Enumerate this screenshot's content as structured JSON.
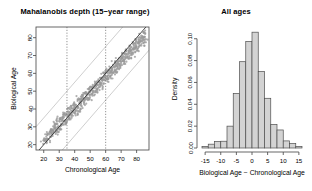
{
  "figure": {
    "background": "#ffffff",
    "panels": [
      "scatter",
      "histogram"
    ]
  },
  "scatter_panel": {
    "title": "Mahalanobis depth (15−year range)",
    "xlabel": "Chronological Age",
    "ylabel": "Biological Age"
  },
  "hist_panel": {
    "title": "All ages",
    "xlabel": "Biological Age − Chronological Age",
    "ylabel": "Density"
  },
  "chart_data": [
    {
      "type": "scatter",
      "title": "Mahalanobis depth (15−year range)",
      "xlabel": "Chronological Age",
      "ylabel": "Biological Age",
      "xlim": [
        15,
        88
      ],
      "ylim": [
        17,
        86
      ],
      "xticks": [
        20,
        30,
        40,
        50,
        60,
        70,
        80
      ],
      "yticks": [
        20,
        30,
        40,
        50,
        60,
        70,
        80
      ],
      "grid": false,
      "point_color": "#9a9a9a",
      "point_size": 1.1,
      "n_points": 620,
      "annotations": [
        {
          "kind": "identity-line",
          "style": "solid-dark",
          "color": "#2b2b2b",
          "slope": 1,
          "intercept": 0
        },
        {
          "kind": "upper-band-line",
          "style": "solid-light",
          "color": "#c8c8c8",
          "slope": 1,
          "intercept": 15
        },
        {
          "kind": "lower-band-line",
          "style": "solid-light",
          "color": "#c8c8c8",
          "slope": 1,
          "intercept": -15
        },
        {
          "kind": "vertical-cut-low",
          "style": "dotted",
          "color": "#777777",
          "x": 35
        },
        {
          "kind": "vertical-cut-high",
          "style": "dotted",
          "color": "#777777",
          "x": 60
        }
      ],
      "points": [
        [
          19.5,
          21.0
        ],
        [
          20.2,
          22.4
        ],
        [
          21.0,
          23.1
        ],
        [
          21.4,
          21.8
        ],
        [
          22.0,
          24.6
        ],
        [
          22.6,
          25.4
        ],
        [
          23.1,
          23.0
        ],
        [
          23.5,
          26.2
        ],
        [
          24.0,
          27.1
        ],
        [
          24.4,
          25.0
        ],
        [
          24.9,
          28.4
        ],
        [
          25.2,
          26.6
        ],
        [
          25.6,
          29.0
        ],
        [
          26.0,
          27.4
        ],
        [
          26.4,
          30.1
        ],
        [
          26.8,
          28.2
        ],
        [
          27.1,
          31.0
        ],
        [
          27.5,
          29.3
        ],
        [
          27.9,
          26.8
        ],
        [
          28.2,
          32.0
        ],
        [
          28.6,
          30.2
        ],
        [
          29.0,
          28.1
        ],
        [
          29.4,
          33.4
        ],
        [
          29.8,
          31.0
        ],
        [
          30.1,
          29.0
        ],
        [
          30.5,
          34.2
        ],
        [
          30.9,
          32.1
        ],
        [
          31.2,
          30.0
        ],
        [
          31.6,
          35.1
        ],
        [
          32.0,
          33.0
        ],
        [
          32.4,
          31.1
        ],
        [
          32.8,
          36.2
        ],
        [
          33.1,
          34.0
        ],
        [
          33.5,
          32.2
        ],
        [
          33.9,
          37.0
        ],
        [
          34.2,
          35.1
        ],
        [
          34.6,
          33.0
        ],
        [
          35.0,
          38.2
        ],
        [
          35.4,
          36.0
        ],
        [
          35.8,
          34.1
        ],
        [
          36.1,
          39.0
        ],
        [
          36.5,
          37.2
        ],
        [
          36.9,
          35.0
        ],
        [
          37.3,
          40.1
        ],
        [
          37.6,
          38.0
        ],
        [
          38.0,
          36.2
        ],
        [
          38.4,
          41.0
        ],
        [
          38.8,
          39.1
        ],
        [
          39.1,
          37.0
        ],
        [
          39.5,
          42.2
        ],
        [
          39.9,
          40.0
        ],
        [
          40.3,
          38.1
        ],
        [
          40.6,
          43.0
        ],
        [
          41.0,
          41.2
        ],
        [
          41.4,
          39.0
        ],
        [
          41.8,
          44.1
        ],
        [
          42.1,
          42.0
        ],
        [
          42.5,
          40.2
        ],
        [
          42.9,
          45.0
        ],
        [
          43.3,
          43.1
        ],
        [
          43.6,
          41.0
        ],
        [
          44.0,
          46.2
        ],
        [
          44.4,
          44.0
        ],
        [
          44.8,
          42.1
        ],
        [
          45.1,
          47.0
        ],
        [
          45.5,
          45.2
        ],
        [
          45.9,
          43.0
        ],
        [
          46.3,
          48.1
        ],
        [
          46.6,
          46.0
        ],
        [
          47.0,
          44.2
        ],
        [
          47.4,
          49.0
        ],
        [
          47.8,
          47.1
        ],
        [
          48.1,
          45.0
        ],
        [
          48.5,
          50.2
        ],
        [
          48.9,
          48.0
        ],
        [
          49.3,
          46.1
        ],
        [
          49.6,
          51.0
        ],
        [
          50.0,
          49.2
        ],
        [
          50.4,
          47.0
        ],
        [
          50.8,
          52.1
        ],
        [
          51.1,
          50.0
        ],
        [
          51.5,
          48.2
        ],
        [
          51.9,
          53.0
        ],
        [
          52.3,
          51.1
        ],
        [
          52.6,
          49.0
        ],
        [
          53.0,
          54.2
        ],
        [
          53.4,
          52.0
        ],
        [
          53.8,
          50.1
        ],
        [
          54.1,
          55.0
        ],
        [
          54.5,
          53.2
        ],
        [
          54.9,
          51.0
        ],
        [
          55.3,
          56.1
        ],
        [
          55.6,
          54.0
        ],
        [
          56.0,
          52.2
        ],
        [
          56.4,
          57.0
        ],
        [
          56.8,
          55.1
        ],
        [
          57.1,
          53.0
        ],
        [
          57.5,
          58.2
        ],
        [
          57.9,
          56.0
        ],
        [
          58.3,
          54.1
        ],
        [
          58.6,
          59.0
        ],
        [
          59.0,
          57.2
        ],
        [
          59.4,
          55.0
        ],
        [
          59.8,
          60.1
        ],
        [
          60.1,
          58.0
        ],
        [
          60.5,
          56.2
        ],
        [
          60.9,
          61.0
        ],
        [
          61.3,
          59.1
        ],
        [
          61.6,
          57.0
        ],
        [
          62.0,
          62.2
        ],
        [
          62.4,
          60.0
        ],
        [
          62.8,
          58.1
        ],
        [
          63.1,
          63.0
        ],
        [
          63.5,
          61.2
        ],
        [
          63.9,
          59.0
        ],
        [
          64.3,
          64.1
        ],
        [
          64.6,
          62.0
        ],
        [
          65.0,
          60.2
        ],
        [
          65.4,
          65.0
        ],
        [
          65.8,
          63.1
        ],
        [
          66.1,
          61.0
        ],
        [
          66.5,
          66.2
        ],
        [
          66.9,
          64.0
        ],
        [
          67.3,
          62.1
        ],
        [
          67.6,
          67.0
        ],
        [
          68.0,
          65.2
        ],
        [
          68.4,
          63.0
        ],
        [
          68.8,
          68.1
        ],
        [
          69.1,
          66.0
        ],
        [
          69.5,
          64.2
        ],
        [
          69.9,
          69.0
        ],
        [
          70.3,
          67.1
        ],
        [
          70.6,
          65.0
        ],
        [
          71.0,
          70.2
        ],
        [
          71.4,
          68.0
        ],
        [
          71.8,
          66.1
        ],
        [
          72.1,
          71.0
        ],
        [
          72.5,
          69.2
        ],
        [
          72.9,
          67.0
        ],
        [
          73.3,
          72.1
        ],
        [
          73.6,
          70.0
        ],
        [
          74.0,
          68.2
        ],
        [
          74.4,
          73.0
        ],
        [
          74.8,
          71.1
        ],
        [
          75.1,
          69.0
        ],
        [
          75.5,
          74.2
        ],
        [
          75.9,
          72.0
        ],
        [
          76.3,
          70.1
        ],
        [
          76.6,
          75.0
        ],
        [
          77.0,
          73.2
        ],
        [
          77.4,
          71.0
        ],
        [
          77.8,
          76.1
        ],
        [
          78.1,
          74.0
        ],
        [
          78.5,
          72.2
        ],
        [
          78.9,
          77.0
        ],
        [
          79.3,
          75.1
        ],
        [
          79.6,
          73.0
        ],
        [
          80.0,
          78.2
        ],
        [
          80.4,
          76.0
        ],
        [
          80.8,
          74.1
        ],
        [
          81.1,
          79.0
        ],
        [
          81.5,
          77.2
        ],
        [
          81.9,
          75.0
        ],
        [
          82.3,
          80.1
        ],
        [
          82.6,
          78.0
        ],
        [
          83.0,
          76.2
        ],
        [
          83.4,
          81.0
        ],
        [
          83.8,
          79.1
        ],
        [
          84.1,
          77.0
        ],
        [
          84.5,
          82.2
        ],
        [
          84.9,
          80.0
        ],
        [
          85.3,
          78.1
        ],
        [
          85.6,
          83.0
        ],
        [
          86.0,
          81.2
        ]
      ]
    },
    {
      "type": "bar",
      "subtype": "histogram",
      "title": "All ages",
      "xlabel": "Biological Age − Chronological Age",
      "ylabel": "Density",
      "xlim": [
        -16,
        16
      ],
      "ylim": [
        0,
        0.108
      ],
      "xticks": [
        -15,
        -10,
        -5,
        0,
        5,
        10,
        15
      ],
      "xticklabels": [
        "-15",
        "-10",
        "-5",
        "0",
        "5",
        "10",
        "15"
      ],
      "yticks": [
        0.0,
        0.02,
        0.04,
        0.06,
        0.08,
        0.1
      ],
      "yticklabels": [
        "0.00",
        "0.02",
        "0.04",
        "0.06",
        "0.08",
        "0.10"
      ],
      "grid": false,
      "bar_fill": "#d3d3d3",
      "bar_stroke": "#4d4d4d",
      "bin_width": 2,
      "bin_edges": [
        -16,
        -14,
        -12,
        -10,
        -8,
        -6,
        -4,
        -2,
        0,
        2,
        4,
        6,
        8,
        10,
        12,
        14,
        16
      ],
      "bin_centers": [
        -15,
        -13,
        -11,
        -9,
        -7,
        -5,
        -3,
        -1,
        1,
        3,
        5,
        7,
        9,
        11,
        13,
        15
      ],
      "values": [
        0.0015,
        0.0035,
        0.006,
        0.0062,
        0.02,
        0.05,
        0.079,
        0.0975,
        0.106,
        0.07,
        0.0455,
        0.0215,
        0.0165,
        0.0065,
        0.004,
        0.0015
      ]
    }
  ]
}
